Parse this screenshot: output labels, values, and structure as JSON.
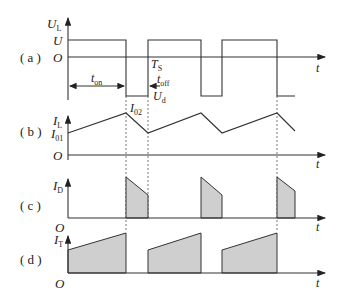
{
  "panels": {
    "a": {
      "tag": "( a )",
      "ylabel": "U",
      "ylabel_sub": "L",
      "level_high": "U",
      "origin": "O",
      "level_low": "U",
      "level_low_sub": "d",
      "period": "T",
      "period_sub": "S",
      "ton": "t",
      "ton_sub": "on",
      "toff": "t",
      "toff_sub": "off",
      "xlabel": "t"
    },
    "b": {
      "tag": "( b )",
      "ylabel": "I",
      "ylabel_sub": "L",
      "min_label": "I",
      "min_label_sub": "01",
      "max_label": "I",
      "max_label_sub": "02",
      "origin": "O",
      "xlabel": "t"
    },
    "c": {
      "tag": "( c )",
      "ylabel": "I",
      "ylabel_sub": "D",
      "origin": "O",
      "xlabel": "t"
    },
    "d": {
      "tag": "( d )",
      "ylabel": "I",
      "ylabel_sub": "T",
      "origin": "O",
      "xlabel": "t"
    }
  },
  "colors": {
    "line": "#333333",
    "fill": "#cfcfcf",
    "text": "#222222"
  }
}
